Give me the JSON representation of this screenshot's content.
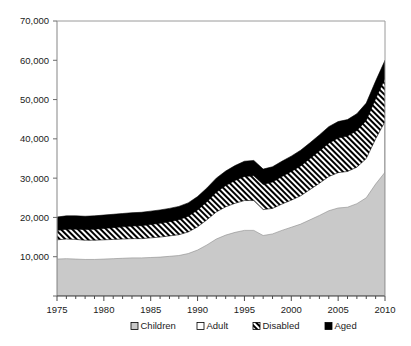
{
  "chart_data": {
    "type": "area",
    "title": "",
    "subtitle": "",
    "xlabel": "",
    "ylabel": "",
    "stacked": true,
    "grid": false,
    "legend_position": "bottom",
    "xlim": [
      1975,
      2010
    ],
    "ylim": [
      0,
      70000
    ],
    "x_tick_labels": [
      "1975",
      "1980",
      "1985",
      "1990",
      "1995",
      "2000",
      "2005",
      "2010"
    ],
    "x_tick_values": [
      1975,
      1980,
      1985,
      1990,
      1995,
      2000,
      2005,
      2010
    ],
    "x_minor_tick_interval": 1,
    "y_tick_labels": [
      "0",
      "10,000",
      "20,000",
      "30,000",
      "40,000",
      "50,000",
      "60,000",
      "70,000"
    ],
    "y_tick_values": [
      0,
      10000,
      20000,
      30000,
      40000,
      50000,
      60000,
      70000
    ],
    "y_axis_zero_label_hidden": true,
    "x": [
      1975,
      1976,
      1977,
      1978,
      1979,
      1980,
      1981,
      1982,
      1983,
      1984,
      1985,
      1986,
      1987,
      1988,
      1989,
      1990,
      1991,
      1992,
      1993,
      1994,
      1995,
      1996,
      1997,
      1998,
      1999,
      2000,
      2001,
      2002,
      2003,
      2004,
      2005,
      2006,
      2007,
      2008,
      2009,
      2010
    ],
    "series": [
      {
        "name": "Children",
        "pattern": "solid-gray",
        "color": "#c9c9c9",
        "values": [
          9400,
          9500,
          9400,
          9300,
          9300,
          9400,
          9500,
          9600,
          9700,
          9700,
          9800,
          9900,
          10100,
          10300,
          10800,
          11700,
          13000,
          14500,
          15500,
          16200,
          16700,
          16700,
          15400,
          15800,
          16700,
          17500,
          18300,
          19400,
          20500,
          21700,
          22400,
          22600,
          23500,
          25000,
          28500,
          31500
        ]
      },
      {
        "name": "Adult",
        "pattern": "white",
        "color": "#ffffff",
        "values": [
          4900,
          5000,
          5000,
          4900,
          4900,
          4900,
          4900,
          4900,
          4900,
          4900,
          5000,
          5100,
          5200,
          5300,
          5500,
          5900,
          6400,
          6900,
          7200,
          7400,
          7600,
          7600,
          6600,
          6500,
          6700,
          6900,
          7200,
          7700,
          8200,
          8700,
          9000,
          9100,
          9300,
          10000,
          11500,
          12900
        ]
      },
      {
        "name": "Disabled",
        "pattern": "diagonal-hatch",
        "color": "#000000",
        "values": [
          2400,
          2500,
          2600,
          2700,
          2800,
          2900,
          3000,
          3100,
          3200,
          3300,
          3400,
          3500,
          3600,
          3800,
          4000,
          4300,
          4600,
          5000,
          5400,
          5800,
          6100,
          6300,
          6400,
          6700,
          7000,
          7300,
          7600,
          7900,
          8200,
          8500,
          8800,
          9000,
          9300,
          9700,
          10200,
          10900
        ]
      },
      {
        "name": "Aged",
        "pattern": "solid-black",
        "color": "#000000",
        "values": [
          3400,
          3400,
          3400,
          3400,
          3400,
          3400,
          3400,
          3400,
          3400,
          3400,
          3400,
          3400,
          3400,
          3400,
          3400,
          3400,
          3500,
          3600,
          3700,
          3800,
          3900,
          3900,
          3900,
          3900,
          3900,
          3900,
          4000,
          4000,
          4100,
          4200,
          4200,
          4200,
          4300,
          4400,
          4500,
          4700
        ]
      }
    ],
    "legend": [
      {
        "label": "Children",
        "marker": "gray-square"
      },
      {
        "label": "Adult",
        "marker": "white-square"
      },
      {
        "label": "Disabled",
        "marker": "hatched-square"
      },
      {
        "label": "Aged",
        "marker": "black-square"
      }
    ]
  }
}
